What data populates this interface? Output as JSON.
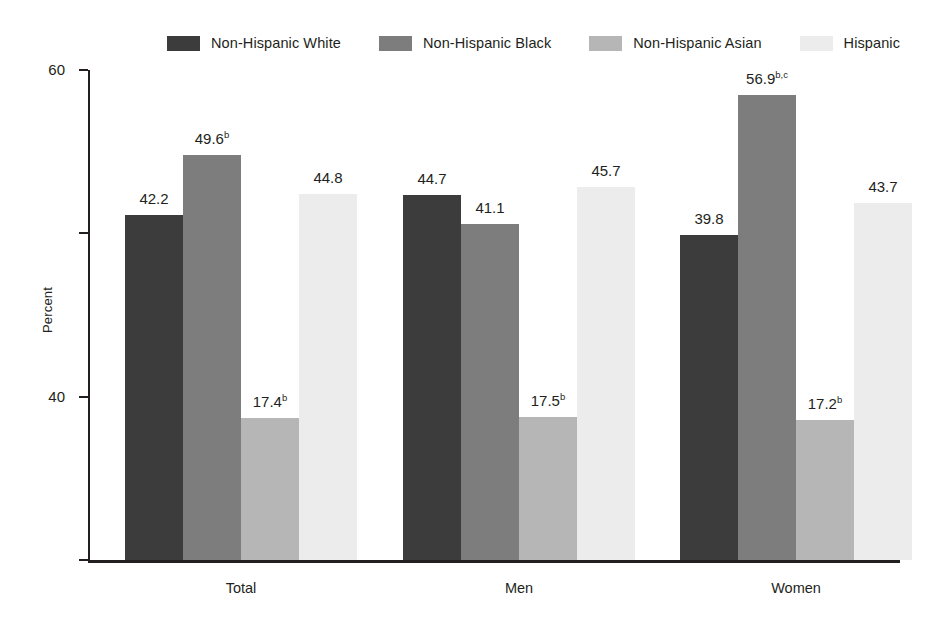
{
  "chart_data": {
    "type": "bar",
    "title": "",
    "subtitle": "",
    "xlabel": "",
    "ylabel": "Percent",
    "ylim": [
      0,
      60
    ],
    "yticks": [
      0,
      20,
      40,
      60
    ],
    "ytick_labels": [
      "0",
      "20",
      "40",
      "60"
    ],
    "grid": false,
    "legend_position": "top",
    "grouped": true,
    "bar_gap_within_group": 0,
    "categories": [
      "Total",
      "Men",
      "Women"
    ],
    "series": [
      {
        "name": "Non-Hispanic White",
        "color": "#3c3c3c",
        "values": [
          42.2,
          44.7,
          39.8
        ],
        "labels": [
          "42.2",
          "44.7",
          "39.8"
        ],
        "footnotes": [
          "",
          "",
          ""
        ]
      },
      {
        "name": "Non-Hispanic Black",
        "color": "#7d7d7d",
        "values": [
          49.6,
          41.1,
          56.9
        ],
        "labels": [
          "49.6",
          "41.1",
          "56.9"
        ],
        "footnotes": [
          "b",
          "",
          "b,c"
        ]
      },
      {
        "name": "Non-Hispanic Asian",
        "color": "#b6b6b6",
        "values": [
          17.4,
          17.5,
          17.2
        ],
        "labels": [
          "17.4",
          "17.5",
          "17.2"
        ],
        "footnotes": [
          "b",
          "b",
          "b"
        ]
      },
      {
        "name": "Hispanic",
        "color": "#ececec",
        "values": [
          44.8,
          45.7,
          43.7
        ],
        "labels": [
          "44.8",
          "45.7",
          "43.7"
        ],
        "footnotes": [
          "",
          "",
          ""
        ]
      }
    ]
  },
  "legend": {
    "items": [
      {
        "label": "Non-Hispanic White",
        "color": "#3c3c3c"
      },
      {
        "label": "Non-Hispanic Black",
        "color": "#7d7d7d"
      },
      {
        "label": "Non-Hispanic Asian",
        "color": "#b6b6b6"
      },
      {
        "label": "Hispanic",
        "color": "#ececec"
      }
    ]
  },
  "axis": {
    "y_label": "Percent",
    "y_ticks": [
      "60",
      "40",
      "20",
      "0"
    ],
    "x_categories": [
      "Total",
      "Men",
      "Women"
    ]
  },
  "colors": {
    "axis": "#231f20",
    "text": "#231f20",
    "background": "#ffffff"
  }
}
